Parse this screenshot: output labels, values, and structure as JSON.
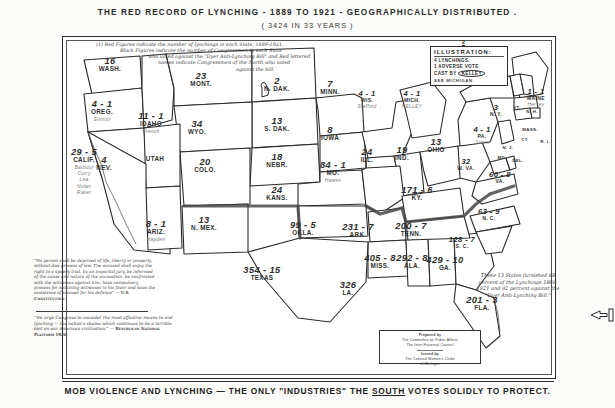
{
  "titles": {
    "main": "THE RED RECORD OF LYNCHING - 1889 TO 1921 - GEOGRAPHICALLY DISTRIBUTED .",
    "sub": "( 3424 IN 33 YEARS )",
    "bottom_pre": "MOB VIOLENCE AND LYNCHING — THE ONLY \"INDUSTRIES\" THE ",
    "bottom_underlined": "SOUTH",
    "bottom_post": " VOTES SOLIDLY TO PROTECT."
  },
  "legend": {
    "line1": "(1) Red Figures indicate the number of lynchings in each State, 1889-1921.",
    "line2": "Black Figures indicate the number of Congressmen in each State",
    "line3": "who voted against the \"Dyer Anti-Lynching Bill\" and Red lettered",
    "line4": "names indicate Congressmen of the North who voted",
    "line5": "against the bill."
  },
  "illustration": {
    "marker": "2",
    "header": "ILLUSTRATION:",
    "line_lynchings": "4 LYNCHINGS.",
    "line_votes": "1 ADVERSE VOTE",
    "line_cast": "CAST BY",
    "name_oval": "KELLEY",
    "see": "SEE MICHIGAN"
  },
  "note_13_states": {
    "text": "These 13 States furnished 88 percent of the Lynchings 1889-1921 and 92 percent against the \"Dyer Anti-Lynching Bill.\"",
    "states_count": "13",
    "pct_lynchings": "88",
    "pct_against": "92"
  },
  "quote_constitution": {
    "text": "\"No person shall be deprived of life, liberty or property without due process of law. The accused shall enjoy the right to a speedy trial, by an impartial jury, be informed of the cause and nature of the accusation, be confronted with the witnesses against him, have compulsory process for obtaining witnesses in his favor and have the assistance of counsel for his defence\" —",
    "source": "U.S. Constitution"
  },
  "quote_platform": {
    "text": "\"We urge Congress to consider the most effective means to end lynching — the nation's shame which continues to be a terrible blot on our American civilization.\" —",
    "source": "Republican National Platform 1920"
  },
  "credit": {
    "l1": "Prepared by",
    "l2": "The Committee on Public Affairs",
    "l3": "The Inter-Fraternal Council",
    "l4": "Issued by",
    "l5": "The Colored Women's Clubs",
    "l6": "of Michigan"
  },
  "chart_data": {
    "type": "map",
    "title": "THE RED RECORD OF LYNCHING - 1889 TO 1921 - GEOGRAPHICALLY DISTRIBUTED",
    "subtitle": "3424 IN 33 YEARS",
    "value_keys": [
      "lynchings",
      "adverse_votes",
      "congressmen"
    ],
    "total_lynchings": 3424,
    "years": "1889-1921",
    "states": [
      {
        "abbr": "WASH.",
        "lynchings": "16",
        "votes": "",
        "reps": "",
        "x": 48,
        "y": 29,
        "size": ""
      },
      {
        "abbr": "OREG.",
        "lynchings": "4",
        "votes": "1",
        "reps": "Sinnott",
        "x": 40,
        "y": 72,
        "size": ""
      },
      {
        "abbr": "IDAHO",
        "lynchings": "11",
        "votes": "1",
        "reps": "French",
        "x": 89,
        "y": 84,
        "size": ""
      },
      {
        "abbr": "MONT.",
        "lynchings": "23",
        "votes": "",
        "reps": "",
        "x": 139,
        "y": 44,
        "size": ""
      },
      {
        "abbr": "N. DAK.",
        "lynchings": "2",
        "votes": "",
        "reps": "",
        "x": 215,
        "y": 49,
        "size": ""
      },
      {
        "abbr": "S. DAK.",
        "lynchings": "13",
        "votes": "",
        "reps": "",
        "x": 215,
        "y": 89,
        "size": ""
      },
      {
        "abbr": "MINN.",
        "lynchings": "7",
        "votes": "",
        "reps": "",
        "x": 268,
        "y": 52,
        "size": ""
      },
      {
        "abbr": "WIS.",
        "lynchings": "4",
        "votes": "1",
        "reps": "Stafford",
        "x": 305,
        "y": 62,
        "size": "sm"
      },
      {
        "abbr": "MICH.",
        "lynchings": "4",
        "votes": "1",
        "reps": "KELLEY",
        "x": 350,
        "y": 62,
        "size": "sm"
      },
      {
        "abbr": "WYO.",
        "lynchings": "34",
        "votes": "",
        "reps": "",
        "x": 135,
        "y": 92,
        "size": ""
      },
      {
        "abbr": "NEBR.",
        "lynchings": "18",
        "votes": "",
        "reps": "",
        "x": 215,
        "y": 125,
        "size": ""
      },
      {
        "abbr": "IOWA",
        "lynchings": "8",
        "votes": "",
        "reps": "",
        "x": 268,
        "y": 98,
        "size": ""
      },
      {
        "abbr": "ILL.",
        "lynchings": "24",
        "votes": "",
        "reps": "",
        "x": 305,
        "y": 120,
        "size": ""
      },
      {
        "abbr": "IND.",
        "lynchings": "19",
        "votes": "",
        "reps": "",
        "x": 340,
        "y": 118,
        "size": ""
      },
      {
        "abbr": "OHIO",
        "lynchings": "13",
        "votes": "",
        "reps": "",
        "x": 374,
        "y": 110,
        "size": ""
      },
      {
        "abbr": "PA.",
        "lynchings": "4",
        "votes": "1",
        "reps": "Jones",
        "x": 420,
        "y": 98,
        "size": "sm"
      },
      {
        "abbr": "NEV.",
        "lynchings": "4",
        "votes": "",
        "reps": "",
        "x": 42,
        "y": 128,
        "size": ""
      },
      {
        "abbr": "UTAH",
        "lynchings": "",
        "votes": "",
        "reps": "",
        "x": 93,
        "y": 128,
        "size": ""
      },
      {
        "abbr": "COLO.",
        "lynchings": "20",
        "votes": "",
        "reps": "",
        "x": 143,
        "y": 130,
        "size": ""
      },
      {
        "abbr": "KANS.",
        "lynchings": "24",
        "votes": "",
        "reps": "",
        "x": 215,
        "y": 158,
        "size": ""
      },
      {
        "abbr": "MO.",
        "lynchings": "84",
        "votes": "1",
        "reps": "Hawes",
        "x": 271,
        "y": 133,
        "size": ""
      },
      {
        "abbr": "KY.",
        "lynchings": "171",
        "votes": "6",
        "reps": "",
        "x": 355,
        "y": 158,
        "size": ""
      },
      {
        "abbr": "W. VA.",
        "lynchings": "32",
        "votes": "",
        "reps": "",
        "x": 404,
        "y": 130,
        "size": "sm"
      },
      {
        "abbr": "VA.",
        "lynchings": "60",
        "votes": "8",
        "reps": "",
        "x": 438,
        "y": 143,
        "size": "sm"
      },
      {
        "abbr": "CALIF.",
        "lynchings": "29",
        "votes": "5",
        "reps": "Barbour Curry Lea Nolan Raker",
        "x": 22,
        "y": 120,
        "size": ""
      },
      {
        "abbr": "ARIZ.",
        "lynchings": "8",
        "votes": "1",
        "reps": "Hayden",
        "x": 94,
        "y": 192,
        "size": ""
      },
      {
        "abbr": "N. MEX.",
        "lynchings": "13",
        "votes": "",
        "reps": "",
        "x": 142,
        "y": 188,
        "size": ""
      },
      {
        "abbr": "OKLA.",
        "lynchings": "99",
        "votes": "5",
        "reps": "",
        "x": 241,
        "y": 193,
        "size": ""
      },
      {
        "abbr": "ARK.",
        "lynchings": "231",
        "votes": "7",
        "reps": "",
        "x": 296,
        "y": 195,
        "size": ""
      },
      {
        "abbr": "TENN.",
        "lynchings": "200",
        "votes": "7",
        "reps": "",
        "x": 349,
        "y": 194,
        "size": ""
      },
      {
        "abbr": "N. C.",
        "lynchings": "63",
        "votes": "9",
        "reps": "",
        "x": 427,
        "y": 180,
        "size": "sm"
      },
      {
        "abbr": "S. C.",
        "lynchings": "128",
        "votes": "7",
        "reps": "",
        "x": 400,
        "y": 208,
        "size": "sm"
      },
      {
        "abbr": "TEXAS",
        "lynchings": "354",
        "votes": "15",
        "reps": "",
        "x": 200,
        "y": 238,
        "size": ""
      },
      {
        "abbr": "LA.",
        "lynchings": "326",
        "votes": "",
        "reps": "",
        "x": 286,
        "y": 253,
        "size": ""
      },
      {
        "abbr": "MISS.",
        "lynchings": "405",
        "votes": "8",
        "reps": "",
        "x": 318,
        "y": 226,
        "size": ""
      },
      {
        "abbr": "ALA.",
        "lynchings": "292",
        "votes": "8",
        "reps": "",
        "x": 350,
        "y": 226,
        "size": ""
      },
      {
        "abbr": "GA.",
        "lynchings": "429",
        "votes": "10",
        "reps": "",
        "x": 383,
        "y": 228,
        "size": ""
      },
      {
        "abbr": "FLA.",
        "lynchings": "201",
        "votes": "3",
        "reps": "",
        "x": 420,
        "y": 268,
        "size": ""
      },
      {
        "abbr": "MAINE",
        "lynchings": "1",
        "votes": "1",
        "reps": "Hersey",
        "x": 474,
        "y": 60,
        "size": "sm"
      },
      {
        "abbr": "N. Y.",
        "lynchings": "3",
        "votes": "",
        "reps": "",
        "x": 434,
        "y": 76,
        "size": "sm"
      },
      {
        "abbr": "VT.",
        "lynchings": "",
        "votes": "",
        "reps": "",
        "x": 455,
        "y": 78,
        "size": "xs"
      },
      {
        "abbr": "N. H.",
        "lynchings": "",
        "votes": "",
        "reps": "",
        "x": 470,
        "y": 82,
        "size": "xs"
      },
      {
        "abbr": "MASS.",
        "lynchings": "",
        "votes": "",
        "reps": "",
        "x": 468,
        "y": 100,
        "size": "xs"
      },
      {
        "abbr": "CT.",
        "lynchings": "",
        "votes": "",
        "reps": "",
        "x": 463,
        "y": 110,
        "size": "xs"
      },
      {
        "abbr": "R. I.",
        "lynchings": "",
        "votes": "",
        "reps": "",
        "x": 483,
        "y": 112,
        "size": "xs"
      },
      {
        "abbr": "N. J.",
        "lynchings": "",
        "votes": "",
        "reps": "",
        "x": 446,
        "y": 118,
        "size": "xs"
      },
      {
        "abbr": "DEL.",
        "lynchings": "",
        "votes": "",
        "reps": "",
        "x": 456,
        "y": 131,
        "size": "xs"
      },
      {
        "abbr": "MD.",
        "lynchings": "",
        "votes": "",
        "reps": "",
        "x": 440,
        "y": 128,
        "size": "xs"
      }
    ]
  },
  "colors": {
    "ink": "#2b2b2b",
    "paper": "#fbfbf9",
    "faint": "#7d7d7d",
    "border": "#333333"
  }
}
